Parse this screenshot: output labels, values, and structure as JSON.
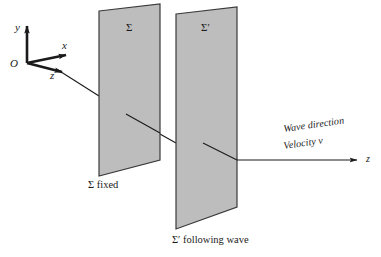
{
  "figure": {
    "background_color": "#ffffff",
    "line_color": "#1a1a1a",
    "plane_fill_color": "#bdbdbd",
    "plane_stroke_color": "#3a3a3a"
  },
  "axes": {
    "origin_label": "O",
    "y_label": "y",
    "x_label": "x",
    "z_label": "z"
  },
  "planes": [
    {
      "name": "Σ",
      "caption": "Σ fixed",
      "fill": "#bdbdbd"
    },
    {
      "name": "Σ′",
      "caption": "Σ′ following wave",
      "fill": "#bdbdbd"
    }
  ],
  "wave": {
    "direction_label": "Wave direction",
    "velocity_label": "Velocity v",
    "axis_end_label": "z"
  }
}
